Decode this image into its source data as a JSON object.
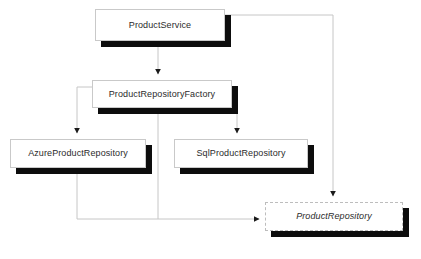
{
  "diagram": {
    "background_color": "#ffffff",
    "box_fill_color": "#ffffff",
    "box_border_color": "#c9c9c9",
    "shadow_color": "#0d0d0d",
    "text_color": "#2b2b2b",
    "connector_color": "#c6c6c6",
    "arrowhead_color": "#1a1a1a",
    "nodes": [
      {
        "id": "product-service",
        "label": "ProductService",
        "kind": "class",
        "x": 95,
        "y": 9,
        "width": 130,
        "height": 32
      },
      {
        "id": "product-repository-factory",
        "label": "ProductRepositoryFactory",
        "kind": "class",
        "x": 92,
        "y": 80,
        "width": 140,
        "height": 28
      },
      {
        "id": "azure-product-repository",
        "label": "AzureProductRepository",
        "kind": "class",
        "x": 10,
        "y": 139,
        "width": 136,
        "height": 29
      },
      {
        "id": "sql-product-repository",
        "label": "SqlProductRepository",
        "kind": "class",
        "x": 174,
        "y": 139,
        "width": 134,
        "height": 29
      },
      {
        "id": "product-repository",
        "label": "ProductRepository",
        "kind": "interface",
        "x": 265,
        "y": 202,
        "width": 138,
        "height": 29
      }
    ],
    "edges": [
      {
        "id": "edge-service-to-factory",
        "from": "product-service",
        "to": "product-repository-factory"
      },
      {
        "id": "edge-factory-to-azure",
        "from": "product-repository-factory",
        "to": "azure-product-repository"
      },
      {
        "id": "edge-factory-to-sql",
        "from": "product-repository-factory",
        "to": "sql-product-repository"
      },
      {
        "id": "edge-service-to-repository",
        "from": "product-service",
        "to": "product-repository"
      },
      {
        "id": "edge-azure-to-repository",
        "from": "azure-product-repository",
        "to": "product-repository"
      },
      {
        "id": "edge-sql-to-repository",
        "from": "sql-product-repository",
        "to": "product-repository"
      }
    ]
  }
}
